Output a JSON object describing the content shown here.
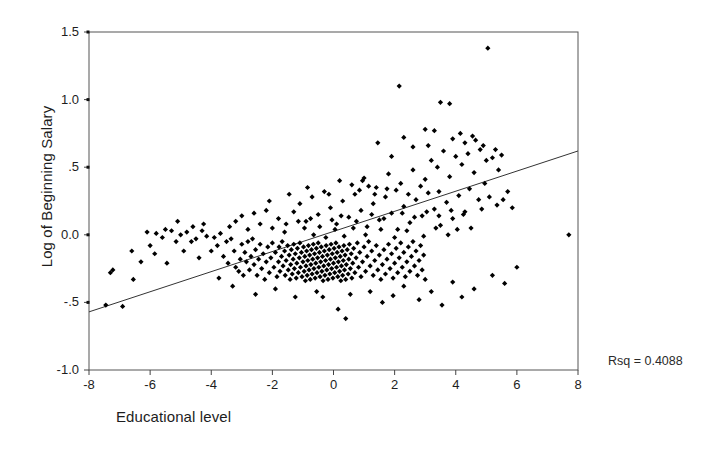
{
  "chart_data": {
    "type": "scatter",
    "title": "",
    "xlabel": "Educational level",
    "ylabel": "Log of Beginning Salary",
    "xlim": [
      -8,
      8
    ],
    "ylim": [
      -1.0,
      1.5
    ],
    "xticks": [
      -8,
      -6,
      -4,
      -2,
      0,
      2,
      4,
      6,
      8
    ],
    "xticklabels": [
      "-8",
      "-6",
      "-4",
      "-2",
      "0",
      "2",
      "4",
      "6",
      "8"
    ],
    "yticks": [
      -1.0,
      -0.5,
      0.0,
      0.5,
      1.0,
      1.5
    ],
    "yticklabels": [
      "-1.0",
      "-.5",
      "0.0",
      ".5",
      "1.0",
      "1.5"
    ],
    "grid": false,
    "legend": null,
    "annotations": [
      {
        "name": "rsq",
        "text": "Rsq = 0.4088",
        "value": 0.4088
      }
    ],
    "fit_line": {
      "name": "linear-regression",
      "slope": 0.0744,
      "intercept": 0.0254,
      "x_start": -8,
      "y_start": -0.57,
      "x_end": 8,
      "y_end": 0.62,
      "color": "#333333"
    },
    "marker": {
      "shape": "diamond",
      "color": "#000000",
      "size": 4
    },
    "point_count": 474,
    "points": [
      [
        -7.45,
        -0.52
      ],
      [
        -7.3,
        -0.28
      ],
      [
        -7.22,
        -0.26
      ],
      [
        -6.9,
        -0.53
      ],
      [
        -6.55,
        -0.33
      ],
      [
        -6.3,
        -0.2
      ],
      [
        -6.0,
        -0.08
      ],
      [
        -5.85,
        -0.14
      ],
      [
        -5.8,
        0.01
      ],
      [
        -5.6,
        -0.02
      ],
      [
        -5.45,
        -0.21
      ],
      [
        -5.3,
        0.03
      ],
      [
        -5.15,
        -0.05
      ],
      [
        -5.0,
        0.0
      ],
      [
        -4.9,
        -0.12
      ],
      [
        -4.8,
        0.02
      ],
      [
        -4.65,
        -0.05
      ],
      [
        -4.5,
        -0.03
      ],
      [
        -4.4,
        -0.17
      ],
      [
        -4.3,
        0.03
      ],
      [
        -4.15,
        -0.01
      ],
      [
        -4.0,
        -0.12
      ],
      [
        -3.9,
        -0.02
      ],
      [
        -3.8,
        -0.08
      ],
      [
        -3.7,
        0.01
      ],
      [
        -3.6,
        -0.16
      ],
      [
        -3.5,
        -0.05
      ],
      [
        -3.45,
        -0.21
      ],
      [
        -3.35,
        -0.03
      ],
      [
        -3.25,
        -0.12
      ],
      [
        -3.2,
        -0.24
      ],
      [
        -3.1,
        -0.27
      ],
      [
        -3.05,
        -0.18
      ],
      [
        -3.0,
        -0.07
      ],
      [
        -2.95,
        -0.3
      ],
      [
        -2.9,
        -0.13
      ],
      [
        -2.85,
        -0.2
      ],
      [
        -2.8,
        -0.05
      ],
      [
        -2.75,
        -0.26
      ],
      [
        -2.7,
        -0.16
      ],
      [
        -2.65,
        -0.03
      ],
      [
        -2.6,
        -0.22
      ],
      [
        -2.55,
        -0.11
      ],
      [
        -2.5,
        -0.3
      ],
      [
        -2.45,
        -0.18
      ],
      [
        -2.4,
        -0.07
      ],
      [
        -2.35,
        -0.25
      ],
      [
        -2.3,
        -0.14
      ],
      [
        -2.25,
        -0.33
      ],
      [
        -2.2,
        -0.2
      ],
      [
        -2.15,
        -0.09
      ],
      [
        -2.1,
        -0.28
      ],
      [
        -2.05,
        -0.17
      ],
      [
        -2.0,
        -0.06
      ],
      [
        -1.95,
        -0.24
      ],
      [
        -1.9,
        -0.13
      ],
      [
        -1.85,
        -0.31
      ],
      [
        -1.8,
        -0.2
      ],
      [
        -1.78,
        -0.09
      ],
      [
        -1.75,
        -0.27
      ],
      [
        -1.7,
        -0.16
      ],
      [
        -1.68,
        -0.05
      ],
      [
        -1.65,
        -0.23
      ],
      [
        -1.6,
        -0.12
      ],
      [
        -1.58,
        -0.3
      ],
      [
        -1.55,
        -0.19
      ],
      [
        -1.5,
        -0.08
      ],
      [
        -1.48,
        -0.26
      ],
      [
        -1.45,
        -0.15
      ],
      [
        -1.42,
        -0.33
      ],
      [
        -1.4,
        -0.22
      ],
      [
        -1.38,
        -0.11
      ],
      [
        -1.35,
        -0.29
      ],
      [
        -1.32,
        -0.18
      ],
      [
        -1.3,
        -0.07
      ],
      [
        -1.28,
        -0.25
      ],
      [
        -1.25,
        -0.14
      ],
      [
        -1.22,
        -0.32
      ],
      [
        -1.2,
        -0.21
      ],
      [
        -1.18,
        -0.1
      ],
      [
        -1.15,
        -0.28
      ],
      [
        -1.12,
        -0.17
      ],
      [
        -1.1,
        -0.06
      ],
      [
        -1.08,
        -0.24
      ],
      [
        -1.05,
        -0.13
      ],
      [
        -1.03,
        -0.31
      ],
      [
        -1.0,
        -0.2
      ],
      [
        -0.98,
        -0.09
      ],
      [
        -0.96,
        -0.27
      ],
      [
        -0.94,
        -0.16
      ],
      [
        -0.92,
        -0.34
      ],
      [
        -0.9,
        -0.23
      ],
      [
        -0.88,
        -0.12
      ],
      [
        -0.86,
        -0.3
      ],
      [
        -0.84,
        -0.19
      ],
      [
        -0.82,
        -0.08
      ],
      [
        -0.8,
        -0.26
      ],
      [
        -0.78,
        -0.15
      ],
      [
        -0.76,
        -0.33
      ],
      [
        -0.74,
        -0.22
      ],
      [
        -0.72,
        -0.11
      ],
      [
        -0.7,
        -0.29
      ],
      [
        -0.68,
        -0.18
      ],
      [
        -0.66,
        -0.07
      ],
      [
        -0.64,
        -0.25
      ],
      [
        -0.62,
        -0.14
      ],
      [
        -0.6,
        -0.32
      ],
      [
        -0.58,
        -0.21
      ],
      [
        -0.56,
        -0.1
      ],
      [
        -0.54,
        -0.28
      ],
      [
        -0.52,
        -0.17
      ],
      [
        -0.5,
        -0.06
      ],
      [
        -0.48,
        -0.24
      ],
      [
        -0.46,
        -0.13
      ],
      [
        -0.44,
        -0.31
      ],
      [
        -0.42,
        -0.2
      ],
      [
        -0.4,
        -0.09
      ],
      [
        -0.38,
        -0.27
      ],
      [
        -0.36,
        -0.16
      ],
      [
        -0.34,
        -0.34
      ],
      [
        -0.32,
        -0.23
      ],
      [
        -0.3,
        -0.12
      ],
      [
        -0.28,
        -0.3
      ],
      [
        -0.26,
        -0.19
      ],
      [
        -0.24,
        -0.08
      ],
      [
        -0.22,
        -0.26
      ],
      [
        -0.2,
        -0.15
      ],
      [
        -0.18,
        -0.33
      ],
      [
        -0.16,
        -0.22
      ],
      [
        -0.14,
        -0.11
      ],
      [
        -0.12,
        -0.29
      ],
      [
        -0.1,
        -0.18
      ],
      [
        -0.08,
        -0.07
      ],
      [
        -0.06,
        -0.25
      ],
      [
        -0.04,
        -0.14
      ],
      [
        -0.02,
        -0.32
      ],
      [
        0.0,
        -0.21
      ],
      [
        0.02,
        -0.1
      ],
      [
        0.04,
        -0.28
      ],
      [
        0.06,
        -0.17
      ],
      [
        0.08,
        -0.06
      ],
      [
        0.1,
        -0.24
      ],
      [
        0.12,
        -0.13
      ],
      [
        0.14,
        -0.31
      ],
      [
        0.16,
        -0.2
      ],
      [
        0.18,
        -0.09
      ],
      [
        0.2,
        -0.27
      ],
      [
        0.22,
        -0.16
      ],
      [
        0.24,
        -0.34
      ],
      [
        0.26,
        -0.23
      ],
      [
        0.28,
        -0.12
      ],
      [
        0.3,
        -0.3
      ],
      [
        0.32,
        -0.19
      ],
      [
        0.34,
        -0.08
      ],
      [
        0.36,
        -0.26
      ],
      [
        0.38,
        -0.15
      ],
      [
        0.4,
        -0.33
      ],
      [
        0.42,
        -0.22
      ],
      [
        0.45,
        -0.11
      ],
      [
        0.48,
        -0.29
      ],
      [
        0.5,
        -0.18
      ],
      [
        0.52,
        -0.07
      ],
      [
        0.55,
        -0.25
      ],
      [
        0.58,
        -0.14
      ],
      [
        0.6,
        -0.32
      ],
      [
        0.63,
        -0.21
      ],
      [
        0.66,
        -0.1
      ],
      [
        0.7,
        -0.28
      ],
      [
        0.74,
        -0.17
      ],
      [
        0.78,
        -0.06
      ],
      [
        0.82,
        -0.24
      ],
      [
        0.86,
        -0.13
      ],
      [
        0.9,
        -0.31
      ],
      [
        0.95,
        -0.2
      ],
      [
        1.0,
        -0.09
      ],
      [
        1.05,
        -0.27
      ],
      [
        1.1,
        -0.16
      ],
      [
        1.15,
        -0.05
      ],
      [
        1.2,
        -0.23
      ],
      [
        1.25,
        -0.12
      ],
      [
        1.3,
        -0.3
      ],
      [
        1.35,
        -0.19
      ],
      [
        1.4,
        -0.08
      ],
      [
        1.45,
        -0.26
      ],
      [
        1.5,
        -0.15
      ],
      [
        1.55,
        -0.33
      ],
      [
        1.6,
        -0.22
      ],
      [
        1.65,
        -0.11
      ],
      [
        1.7,
        -0.29
      ],
      [
        1.75,
        -0.18
      ],
      [
        1.8,
        -0.07
      ],
      [
        1.85,
        -0.25
      ],
      [
        1.9,
        -0.14
      ],
      [
        1.95,
        -0.32
      ],
      [
        2.0,
        -0.21
      ],
      [
        2.05,
        -0.1
      ],
      [
        2.1,
        -0.28
      ],
      [
        2.15,
        -0.17
      ],
      [
        2.2,
        -0.06
      ],
      [
        2.25,
        -0.24
      ],
      [
        2.3,
        -0.13
      ],
      [
        2.35,
        -0.31
      ],
      [
        2.4,
        -0.2
      ],
      [
        2.45,
        -0.09
      ],
      [
        2.5,
        -0.27
      ],
      [
        2.55,
        -0.16
      ],
      [
        2.6,
        -0.05
      ],
      [
        2.65,
        -0.23
      ],
      [
        2.7,
        -0.12
      ],
      [
        2.75,
        -0.3
      ],
      [
        2.8,
        -0.19
      ],
      [
        2.85,
        -0.08
      ],
      [
        2.9,
        -0.26
      ],
      [
        2.95,
        -0.15
      ],
      [
        3.0,
        -0.33
      ],
      [
        -1.3,
        0.17
      ],
      [
        -1.1,
        0.23
      ],
      [
        -0.9,
        0.1
      ],
      [
        -0.7,
        0.28
      ],
      [
        -0.5,
        0.15
      ],
      [
        -0.3,
        0.32
      ],
      [
        -0.1,
        0.2
      ],
      [
        0.1,
        0.08
      ],
      [
        0.3,
        0.25
      ],
      [
        0.5,
        0.13
      ],
      [
        0.7,
        0.3
      ],
      [
        0.9,
        0.18
      ],
      [
        1.1,
        0.06
      ],
      [
        1.3,
        0.23
      ],
      [
        1.5,
        0.11
      ],
      [
        1.7,
        0.28
      ],
      [
        1.9,
        0.16
      ],
      [
        2.1,
        0.04
      ],
      [
        2.3,
        0.21
      ],
      [
        2.5,
        0.09
      ],
      [
        2.7,
        0.26
      ],
      [
        2.9,
        0.14
      ],
      [
        3.1,
        0.31
      ],
      [
        3.3,
        0.19
      ],
      [
        3.5,
        0.07
      ],
      [
        3.7,
        0.24
      ],
      [
        3.9,
        0.12
      ],
      [
        4.1,
        0.29
      ],
      [
        4.3,
        0.17
      ],
      [
        4.5,
        0.05
      ],
      [
        -2.4,
        0.08
      ],
      [
        -2.2,
        0.18
      ],
      [
        -2.0,
        0.05
      ],
      [
        -1.8,
        0.12
      ],
      [
        -1.6,
        0.02
      ],
      [
        -3.2,
        0.1
      ],
      [
        -3.0,
        0.14
      ],
      [
        -2.8,
        0.04
      ],
      [
        -2.6,
        0.16
      ],
      [
        -3.4,
        0.06
      ],
      [
        0.2,
        0.4
      ],
      [
        0.6,
        0.37
      ],
      [
        1.0,
        0.42
      ],
      [
        1.4,
        0.35
      ],
      [
        1.8,
        0.45
      ],
      [
        2.2,
        0.38
      ],
      [
        2.6,
        0.48
      ],
      [
        3.0,
        0.41
      ],
      [
        3.4,
        0.5
      ],
      [
        3.8,
        0.43
      ],
      [
        4.2,
        0.52
      ],
      [
        4.6,
        0.46
      ],
      [
        5.0,
        0.55
      ],
      [
        5.4,
        0.48
      ],
      [
        4.0,
        0.58
      ],
      [
        3.6,
        0.62
      ],
      [
        4.4,
        0.6
      ],
      [
        4.8,
        0.63
      ],
      [
        3.2,
        0.55
      ],
      [
        5.2,
        0.57
      ],
      [
        2.3,
        0.72
      ],
      [
        3.0,
        0.78
      ],
      [
        3.3,
        0.77
      ],
      [
        2.15,
        1.1
      ],
      [
        3.5,
        0.98
      ],
      [
        3.8,
        0.97
      ],
      [
        5.05,
        1.38
      ],
      [
        1.45,
        0.68
      ],
      [
        0.95,
        0.4
      ],
      [
        1.9,
        0.58
      ],
      [
        2.6,
        0.65
      ],
      [
        3.1,
        0.66
      ],
      [
        3.9,
        0.71
      ],
      [
        4.3,
        0.68
      ],
      [
        4.65,
        0.7
      ],
      [
        4.9,
        0.66
      ],
      [
        5.3,
        0.63
      ],
      [
        5.5,
        0.59
      ],
      [
        4.15,
        0.75
      ],
      [
        4.55,
        0.73
      ],
      [
        1.95,
        -0.45
      ],
      [
        2.3,
        -0.38
      ],
      [
        3.2,
        -0.42
      ],
      [
        3.9,
        -0.35
      ],
      [
        4.6,
        -0.4
      ],
      [
        5.2,
        -0.3
      ],
      [
        2.8,
        -0.48
      ],
      [
        3.55,
        -0.52
      ],
      [
        4.2,
        -0.46
      ],
      [
        5.6,
        -0.36
      ],
      [
        0.55,
        -0.44
      ],
      [
        1.2,
        -0.42
      ],
      [
        1.6,
        -0.5
      ],
      [
        0.15,
        -0.55
      ],
      [
        -0.35,
        -0.46
      ],
      [
        -0.55,
        -0.42
      ],
      [
        0.4,
        -0.62
      ],
      [
        7.7,
        0.0
      ],
      [
        6.0,
        -0.24
      ],
      [
        5.85,
        0.2
      ],
      [
        5.7,
        0.32
      ],
      [
        4.95,
        0.38
      ],
      [
        -4.25,
        0.08
      ],
      [
        -4.6,
        0.06
      ],
      [
        -5.1,
        0.1
      ],
      [
        -5.5,
        0.04
      ],
      [
        -6.1,
        0.02
      ],
      [
        -6.6,
        -0.12
      ],
      [
        -2.1,
        0.25
      ],
      [
        -1.45,
        0.3
      ],
      [
        -0.85,
        0.35
      ],
      [
        -0.15,
        0.3
      ],
      [
        0.85,
        0.33
      ],
      [
        1.35,
        0.3
      ],
      [
        2.05,
        0.33
      ],
      [
        -3.75,
        -0.32
      ],
      [
        -3.3,
        -0.38
      ],
      [
        -2.55,
        -0.44
      ],
      [
        -1.9,
        -0.4
      ],
      [
        -1.25,
        -0.46
      ],
      [
        4.45,
        0.34
      ],
      [
        4.75,
        0.26
      ],
      [
        5.1,
        0.28
      ],
      [
        5.35,
        0.22
      ],
      [
        5.55,
        0.26
      ],
      [
        3.45,
        0.32
      ],
      [
        2.85,
        0.36
      ],
      [
        2.45,
        0.3
      ],
      [
        1.75,
        0.34
      ],
      [
        1.15,
        0.36
      ],
      [
        -0.95,
        0.05
      ],
      [
        -0.65,
        0.0
      ],
      [
        -0.45,
        0.06
      ],
      [
        -0.25,
        -0.02
      ],
      [
        0.05,
        0.04
      ],
      [
        0.35,
        -0.01
      ],
      [
        0.65,
        0.05
      ],
      [
        1.05,
        0.0
      ],
      [
        1.55,
        0.04
      ],
      [
        2.0,
        -0.02
      ],
      [
        2.4,
        0.03
      ],
      [
        2.95,
        -0.01
      ],
      [
        3.35,
        0.05
      ],
      [
        3.75,
        0.0
      ],
      [
        4.05,
        0.04
      ],
      [
        -1.55,
        0.08
      ],
      [
        -1.15,
        0.1
      ],
      [
        -0.75,
        0.12
      ],
      [
        -0.05,
        0.11
      ],
      [
        0.25,
        0.14
      ],
      [
        0.75,
        0.1
      ],
      [
        1.25,
        0.15
      ],
      [
        1.65,
        0.12
      ],
      [
        2.25,
        0.16
      ],
      [
        2.65,
        0.13
      ],
      [
        3.05,
        0.17
      ],
      [
        3.45,
        0.14
      ],
      [
        3.85,
        0.18
      ],
      [
        4.25,
        0.15
      ],
      [
        4.85,
        0.19
      ]
    ]
  }
}
